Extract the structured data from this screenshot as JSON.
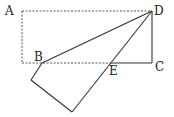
{
  "diagram": {
    "type": "geometry-fold",
    "points": {
      "A": {
        "label": "A",
        "x": 22,
        "y": 11
      },
      "D": {
        "label": "D",
        "x": 152,
        "y": 11
      },
      "C": {
        "label": "C",
        "x": 152,
        "y": 63
      },
      "B": {
        "label": "B",
        "x": 42,
        "y": 63
      },
      "E": {
        "label": "E",
        "x": 111,
        "y": 63
      },
      "P": {
        "x": 31,
        "y": 80
      },
      "Q": {
        "x": 72,
        "y": 112
      }
    },
    "labels": {
      "A": "A",
      "B": "B",
      "C": "C",
      "D": "D",
      "E": "E"
    },
    "colors": {
      "solid": "#333333",
      "dashed": "#555555"
    }
  }
}
